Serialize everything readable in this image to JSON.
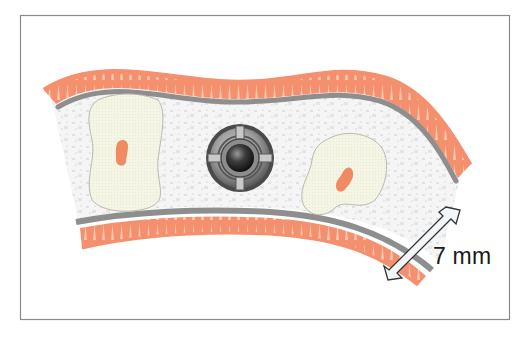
{
  "figure": {
    "measurement_label": "7 mm",
    "elements": [
      {
        "name": "upper-gum-band",
        "kind": "soft tissue (gingiva)"
      },
      {
        "name": "upper-cortical-layer",
        "kind": "gray cortical bone line"
      },
      {
        "name": "cancellous-bone",
        "kind": "speckled inner bone"
      },
      {
        "name": "left-tooth-root",
        "kind": "root with pulp canal"
      },
      {
        "name": "implant-screw-head",
        "kind": "cross-slotted circular implant"
      },
      {
        "name": "right-tooth-root",
        "kind": "root with pulp canal"
      },
      {
        "name": "lower-cortical-layer",
        "kind": "gray cortical bone line"
      },
      {
        "name": "lower-gum-band",
        "kind": "soft tissue (gingiva)"
      },
      {
        "name": "measurement-arrow",
        "kind": "double-headed dimension arrow"
      }
    ]
  },
  "colors": {
    "gum": "#f4906e",
    "gum_light": "#fbc6ad",
    "cortical": "#8e8e8e",
    "cortical_edge": "#6f6f6f",
    "bone_bg": "#f4f4f4",
    "bone_speckle": "#e2e2e2",
    "root_fill": "#f3f4e2",
    "root_stroke": "#b9b9b0",
    "pulp": "#ef8a62",
    "implant_dark": "#3a3a3a",
    "implant_mid": "#8a8a8a",
    "frame": "#8a8a8a",
    "arrow_fill": "#f3f6f8",
    "arrow_stroke": "#333333"
  }
}
